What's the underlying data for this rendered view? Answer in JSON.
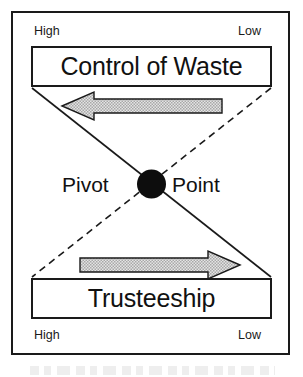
{
  "diagram": {
    "type": "seesaw-balance",
    "title_top": "Control of Waste",
    "title_bottom": "Trusteeship",
    "pivot": {
      "word_left": "Pivot",
      "word_right": "Point"
    },
    "scales": {
      "top": {
        "left_label": "High",
        "right_label": "Low"
      },
      "bottom": {
        "left_label": "High",
        "right_label": "Low"
      }
    },
    "arrows": [
      {
        "name": "top-arrow",
        "direction": "left",
        "meaning": "Control of Waste decreases toward Low"
      },
      {
        "name": "bottom-arrow",
        "direction": "right",
        "meaning": "Trusteeship increases toward Low"
      }
    ],
    "connectors": [
      {
        "name": "solid-diagonal",
        "style": "solid",
        "from": "top-left",
        "to": "bottom-right"
      },
      {
        "name": "dashed-diagonal",
        "style": "dashed",
        "from": "top-right",
        "to": "bottom-left"
      }
    ],
    "colors": {
      "stroke": "#1a1a1a",
      "text": "#111111",
      "arrow_fill": "#c9c9c9",
      "arrow_stroke": "#1a1a1a",
      "pivot_fill": "#0d0d0d",
      "background": "#ffffff"
    }
  }
}
